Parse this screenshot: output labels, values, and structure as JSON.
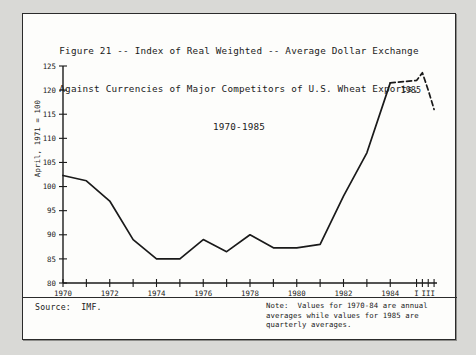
{
  "figure": {
    "title_lines": [
      "Figure 21 -- Index of Real Weighted -- Average Dollar Exchange",
      "Against Currencies of Major Competitors of U.S. Wheat Exports,",
      "1970-1985"
    ],
    "source": "Source:  IMF.",
    "note_lines": [
      "Note:  Values for 1970-84 are annual",
      "averages while values for 1985 are",
      "quarterly averages."
    ],
    "annotation_1985": "1985"
  },
  "chart_data": {
    "type": "line",
    "title": "Figure 21 -- Index of Real Weighted -- Average Dollar Exchange Against Currencies of Major Competitors of U.S. Wheat Exports, 1970-1985",
    "xlabel": "",
    "ylabel": "April, 1971 = 100",
    "ylim": [
      80,
      125
    ],
    "ytick_step": 5,
    "yticks": [
      80,
      85,
      90,
      95,
      100,
      105,
      110,
      115,
      120,
      125
    ],
    "ytick_labels": [
      "80",
      "85",
      "90",
      "95",
      "100",
      "105",
      "110",
      "115",
      "120",
      "125"
    ],
    "xticks": [
      1970,
      1971,
      1972,
      1973,
      1974,
      1975,
      1976,
      1977,
      1978,
      1979,
      1980,
      1981,
      1982,
      1983,
      1984,
      1985.125,
      1985.375,
      1985.625,
      1985.875
    ],
    "xtick_labels": [
      "1970",
      "",
      "1972",
      "",
      "1974",
      "",
      "1976",
      "",
      "1978",
      "",
      "1980",
      "",
      "1982",
      "",
      "1984",
      "I",
      "",
      "III",
      ""
    ],
    "xlim": [
      1970,
      1986
    ],
    "grid": false,
    "legend": false,
    "series": [
      {
        "name": "Annual averages 1970-1984",
        "style": "solid",
        "x": [
          1970,
          1971,
          1972,
          1973,
          1974,
          1975,
          1976,
          1977,
          1978,
          1979,
          1980,
          1981,
          1982,
          1983,
          1984
        ],
        "values": [
          102.3,
          101.2,
          97.0,
          89.0,
          85.0,
          85.0,
          89.0,
          86.5,
          90.0,
          87.3,
          87.3,
          88.0,
          98.0,
          107.0,
          121.5
        ]
      },
      {
        "name": "1985 quarterly averages",
        "style": "dashed",
        "x": [
          1984,
          1985.125,
          1985.375,
          1985.625,
          1985.875
        ],
        "x_labels": [
          "1984",
          "I",
          "II",
          "III",
          "IV"
        ],
        "values": [
          121.5,
          122.0,
          123.6,
          120.0,
          116.0
        ]
      }
    ]
  }
}
